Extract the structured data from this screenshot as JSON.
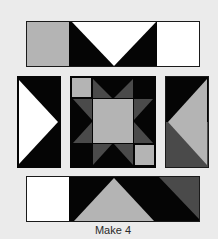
{
  "colors": {
    "background": "#ebebeb",
    "black": "#050505",
    "white": "#ffffff",
    "light_gray": "#b4b4b4",
    "dark_gray": "#4a4a4a",
    "border": "#1a1a1a"
  },
  "diagram": {
    "type": "quilt-block-assembly",
    "units": [
      {
        "name": "top-row",
        "description": "gray square, flying geese (black sides, white center triangle pointing down), white square"
      },
      {
        "name": "left-column",
        "description": "flying geese unit, black background with white triangle pointing right"
      },
      {
        "name": "center-star",
        "description": "sawtooth star: light gray center, dark gray star points, black background, light gray corner squares top-left and bottom-right"
      },
      {
        "name": "right-column",
        "description": "black top, dark gray bottom, light gray triangle pointing left"
      },
      {
        "name": "bottom-row",
        "description": "white square, black rectangle with light gray triangle pointing up, dark gray triangle at right"
      }
    ]
  },
  "caption": "Make 4"
}
